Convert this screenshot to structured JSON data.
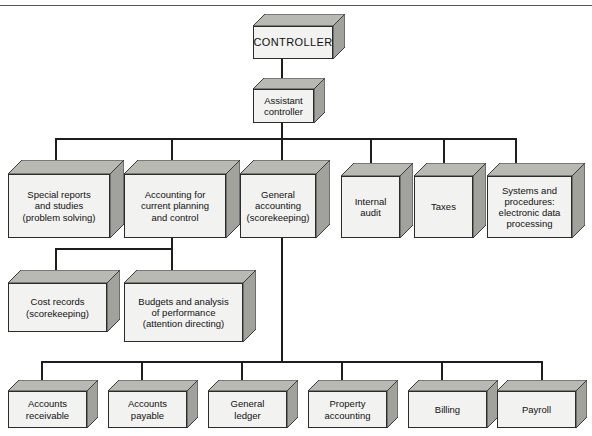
{
  "diagram": {
    "colors": {
      "box_front": "#f2f2f0",
      "box_top": "#b9b9b4",
      "box_side": "#a2a29d",
      "line": "#1d1d1b",
      "rule": "#555553",
      "text": "#111111"
    },
    "levels": [
      {
        "name": "level-1",
        "nodes": [
          {
            "id": "controller",
            "label": "CONTROLLER"
          }
        ]
      },
      {
        "name": "level-2",
        "nodes": [
          {
            "id": "assistant-controller",
            "label": "Assistant\ncontroller"
          }
        ]
      },
      {
        "name": "level-3",
        "nodes": [
          {
            "id": "special-reports",
            "label": "Special reports\nand studies\n(problem solving)"
          },
          {
            "id": "accounting-current-planning",
            "label": "Accounting for\ncurrent planning\nand control"
          },
          {
            "id": "general-accounting",
            "label": "General\naccounting\n(scorekeeping)"
          },
          {
            "id": "internal-audit",
            "label": "Internal\naudit"
          },
          {
            "id": "taxes",
            "label": "Taxes"
          },
          {
            "id": "systems-procedures",
            "label": "Systems and\nprocedures:\nelectronic data\nprocessing"
          }
        ]
      },
      {
        "name": "level-4",
        "nodes": [
          {
            "id": "cost-records",
            "label": "Cost records\n(scorekeeping)"
          },
          {
            "id": "budgets-analysis",
            "label": "Budgets and analysis\nof performance\n(attention directing)"
          }
        ]
      },
      {
        "name": "level-5",
        "nodes": [
          {
            "id": "accounts-receivable",
            "label": "Accounts\nreceivable"
          },
          {
            "id": "accounts-payable",
            "label": "Accounts\npayable"
          },
          {
            "id": "general-ledger",
            "label": "General\nledger"
          },
          {
            "id": "property-accounting",
            "label": "Property\naccounting"
          },
          {
            "id": "billing",
            "label": "Billing"
          },
          {
            "id": "payroll",
            "label": "Payroll"
          }
        ]
      }
    ]
  }
}
